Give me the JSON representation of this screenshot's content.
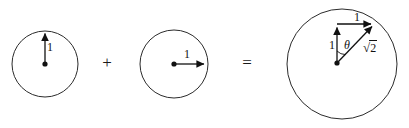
{
  "figure": {
    "stroke_color": "#2b2b2b",
    "text_color": "#111111",
    "background_color": "#ffffff",
    "width": 409,
    "height": 128
  },
  "operators": {
    "plus": "+",
    "equals": "="
  },
  "circle_left": {
    "name": "unit-circle-vertical",
    "center_x": 45,
    "center_y": 64,
    "radius": 33,
    "vector_label": "1",
    "vector_direction": "up"
  },
  "circle_middle": {
    "name": "unit-circle-horizontal",
    "center_x": 174,
    "center_y": 64,
    "radius": 34,
    "vector_label": "1",
    "vector_direction": "right"
  },
  "circle_right": {
    "name": "resultant-circle",
    "center_x": 342,
    "center_y": 64,
    "radius": 55,
    "vertical_label": "1",
    "horizontal_label": "1",
    "hypotenuse_label_sign": "√",
    "hypotenuse_label_body": "2",
    "angle_label": "θ"
  }
}
